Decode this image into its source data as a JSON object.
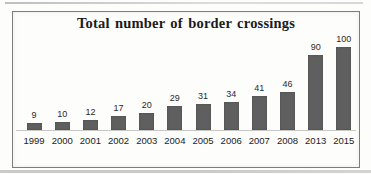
{
  "chart_data": {
    "type": "bar",
    "title": "Total number of border crossings",
    "categories": [
      "1999",
      "2000",
      "2001",
      "2002",
      "2003",
      "2004",
      "2005",
      "2006",
      "2007",
      "2008",
      "2013",
      "2015"
    ],
    "values": [
      9,
      10,
      12,
      17,
      20,
      29,
      31,
      34,
      41,
      46,
      90,
      100
    ],
    "xlabel": "",
    "ylabel": "",
    "ylim": [
      0,
      105
    ],
    "grid": false,
    "legend": null,
    "data_labels": true,
    "bar_color": "#5f5f5f",
    "axis_line_color": "#c7c7c4",
    "frame_border_color": "#7d7d7b",
    "background_color": "#fdfdfb",
    "title_color": "#1b1b1b",
    "label_color": "#2a2a2a"
  }
}
